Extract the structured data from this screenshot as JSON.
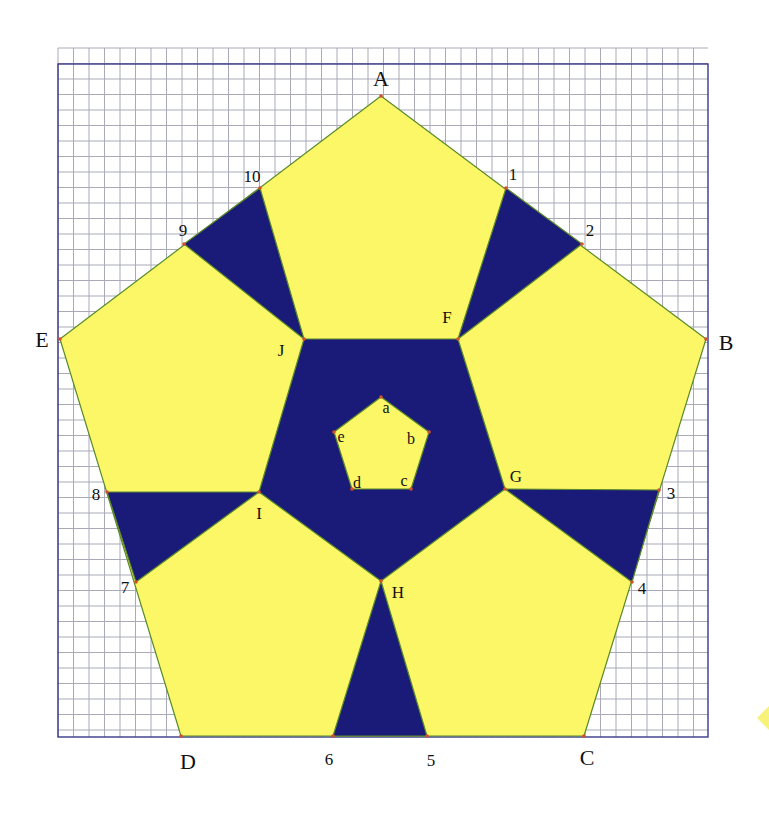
{
  "colors": {
    "yellow": "#fbf766",
    "navy": "#1a1a78",
    "grid_line": "#a9a9b8",
    "border": "#3a3a8a",
    "edge": "#5a8a2a",
    "vertex_dot": "#d2502a",
    "side_marker": "#f7f27a"
  },
  "grid": {
    "x0": 58,
    "y0": 48,
    "x1": 708,
    "y1": 737,
    "step": 15.5,
    "border_top": 64
  },
  "outer_vertices": {
    "A": {
      "label": "A",
      "x": 381,
      "y": 96,
      "lx": 381,
      "ly": 86
    },
    "B": {
      "label": "B",
      "x": 706,
      "y": 339,
      "lx": 726,
      "ly": 350
    },
    "C": {
      "label": "C",
      "x": 584,
      "y": 736,
      "lx": 587,
      "ly": 765
    },
    "D": {
      "label": "D",
      "x": 181,
      "y": 736,
      "lx": 188,
      "ly": 769
    },
    "E": {
      "label": "E",
      "x": 60,
      "y": 339,
      "lx": 42,
      "ly": 347
    }
  },
  "side_points": [
    {
      "label": "1",
      "x": 506,
      "y": 188,
      "lx": 513,
      "ly": 180
    },
    {
      "label": "2",
      "x": 582,
      "y": 244,
      "lx": 590,
      "ly": 236
    },
    {
      "label": "3",
      "x": 659,
      "y": 490,
      "lx": 671,
      "ly": 499
    },
    {
      "label": "4",
      "x": 632,
      "y": 582,
      "lx": 642,
      "ly": 594
    },
    {
      "label": "5",
      "x": 427,
      "y": 736,
      "lx": 431,
      "ly": 766
    },
    {
      "label": "6",
      "x": 333,
      "y": 736,
      "lx": 329,
      "ly": 765
    },
    {
      "label": "7",
      "x": 136,
      "y": 582,
      "lx": 125,
      "ly": 593
    },
    {
      "label": "8",
      "x": 107,
      "y": 492,
      "lx": 96,
      "ly": 500
    },
    {
      "label": "9",
      "x": 184,
      "y": 244,
      "lx": 183,
      "ly": 236
    },
    {
      "label": "10",
      "x": 260,
      "y": 188,
      "lx": 252,
      "ly": 182
    }
  ],
  "middle_vertices": {
    "F": {
      "label": "F",
      "x": 458,
      "y": 339,
      "lx": 447,
      "ly": 323
    },
    "G": {
      "label": "G",
      "x": 505,
      "y": 489,
      "lx": 516,
      "ly": 482
    },
    "H": {
      "label": "H",
      "x": 381,
      "y": 581,
      "lx": 398,
      "ly": 598
    },
    "I": {
      "label": "I",
      "x": 259,
      "y": 492,
      "lx": 259,
      "ly": 519
    },
    "J": {
      "label": "J",
      "x": 304,
      "y": 339,
      "lx": 281,
      "ly": 356
    }
  },
  "inner_vertices": {
    "a": {
      "label": "a",
      "x": 381,
      "y": 397,
      "lx": 386,
      "ly": 413
    },
    "b": {
      "label": "b",
      "x": 429,
      "y": 432,
      "lx": 411,
      "ly": 444
    },
    "c": {
      "label": "c",
      "x": 411,
      "y": 489,
      "lx": 404,
      "ly": 486
    },
    "d": {
      "label": "d",
      "x": 352,
      "y": 489,
      "lx": 357,
      "ly": 488
    },
    "e": {
      "label": "e",
      "x": 334,
      "y": 432,
      "lx": 341,
      "ly": 442
    }
  },
  "side_marker": {
    "x": 769,
    "y": 718
  }
}
